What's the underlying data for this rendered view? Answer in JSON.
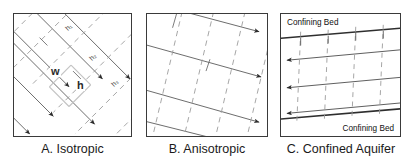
{
  "figure": {
    "title_absent": true,
    "background_color": "#ffffff",
    "line_color": "#3a3a3a",
    "dashed_color": "#8f8f8f",
    "text_color": "#1a1a1a"
  },
  "panels": [
    {
      "id": "a",
      "caption": "A. Isotropic",
      "labels": {
        "width_symbol": "w",
        "height_symbol": "h",
        "head_contours": [
          "h₁",
          "h₂",
          "h₃"
        ]
      },
      "flow_lines": {
        "style": "solid",
        "direction": "down-right",
        "arrowheads": 3,
        "angle_deg": 45
      },
      "equipotential_lines": {
        "style": "dashed",
        "direction": "down-left",
        "angle_deg": -45,
        "orthogonal_to_flow": true
      }
    },
    {
      "id": "b",
      "caption": "B. Anisotropic",
      "labels": {
        "head_contours": []
      },
      "flow_lines": {
        "style": "solid",
        "direction": "down-right",
        "arrowheads": 4,
        "angle_deg": 22
      },
      "equipotential_lines": {
        "style": "dashed",
        "direction": "down-left",
        "angle_deg": -68,
        "orthogonal_to_flow": false
      }
    },
    {
      "id": "c",
      "caption": "C. Confined Aquifer",
      "labels": {
        "confining_bed_top": "Confining Bed",
        "confining_bed_bottom": "Confining Bed"
      },
      "flow_lines": {
        "style": "solid",
        "direction": "left",
        "arrowheads": 3,
        "angle_deg": 188
      },
      "equipotential_lines": {
        "style": "dashed",
        "direction": "vertical",
        "orthogonal_to_flow": true
      }
    }
  ]
}
